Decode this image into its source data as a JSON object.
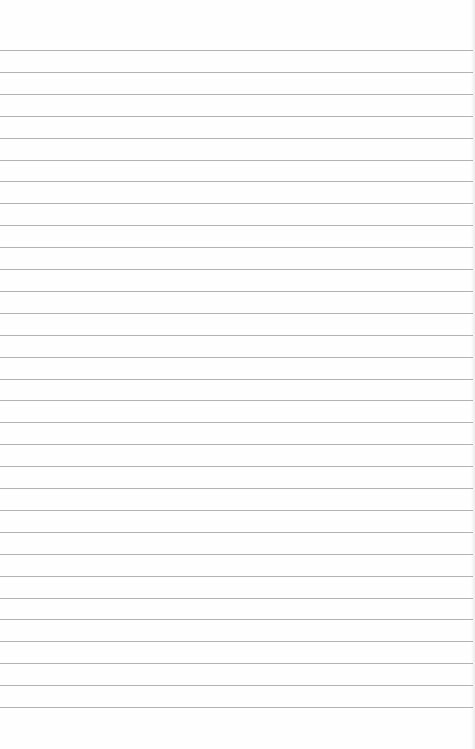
{
  "page": {
    "type": "ruled-notebook-paper",
    "background_color": "#fefefe",
    "rule_color": "#9a9a9a",
    "first_rule_y": 50,
    "rule_spacing": 21.9,
    "rule_count": 31
  }
}
